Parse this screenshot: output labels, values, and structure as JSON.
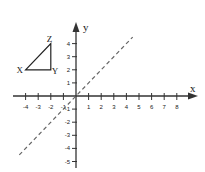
{
  "diagram": {
    "x_axis_label": "x",
    "y_axis_label": "y",
    "x_ticks": [
      "-4",
      "-3",
      "-2",
      "-1",
      "1",
      "2",
      "3",
      "4",
      "5",
      "6",
      "7",
      "8"
    ],
    "y_ticks": [
      "4",
      "3",
      "2",
      "1",
      "-1",
      "-2",
      "-3",
      "-4",
      "-5"
    ],
    "triangle": {
      "vertices": [
        {
          "label": "X",
          "x": -4,
          "y": 2
        },
        {
          "label": "Y",
          "x": -2,
          "y": 2
        },
        {
          "label": "Z",
          "x": -2,
          "y": 4
        }
      ]
    },
    "dashed_line": {
      "equation": "y = x",
      "from": [
        -4.5,
        -4.5
      ],
      "to": [
        4.5,
        4.5
      ]
    }
  }
}
